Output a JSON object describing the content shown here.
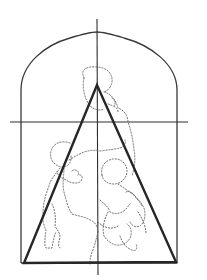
{
  "diagram": {
    "type": "composition-analysis",
    "description": "Arched-top frame with central vertical and horizontal axes, a bold isosceles triangle, and dotted outlines of figures grouped within the triangle",
    "colors": {
      "background": "#ffffff",
      "frame": "#3a3a3a",
      "axes": "#2e2e2e",
      "triangle": "#262626",
      "figure_outline": "#6a6a6a"
    },
    "elements": [
      {
        "name": "arched-frame",
        "style": "solid thin"
      },
      {
        "name": "vertical-axis",
        "style": "solid thin"
      },
      {
        "name": "horizontal-axis",
        "style": "solid thin"
      },
      {
        "name": "composition-triangle",
        "style": "solid bold"
      },
      {
        "name": "figure-group-outline",
        "style": "dotted"
      }
    ],
    "geometry": {
      "frame": {
        "left": 21,
        "right": 177,
        "bottom": 263,
        "arch_spring": 88,
        "arch_top": 32
      },
      "vertical_axis": {
        "x": 97,
        "y1": 19,
        "y2": 275
      },
      "horizontal_axis": {
        "y": 122,
        "x1": 10,
        "x2": 188
      },
      "triangle": {
        "apex": [
          97,
          85
        ],
        "base_left": [
          24,
          263
        ],
        "base_right": [
          176,
          262
        ]
      }
    }
  }
}
